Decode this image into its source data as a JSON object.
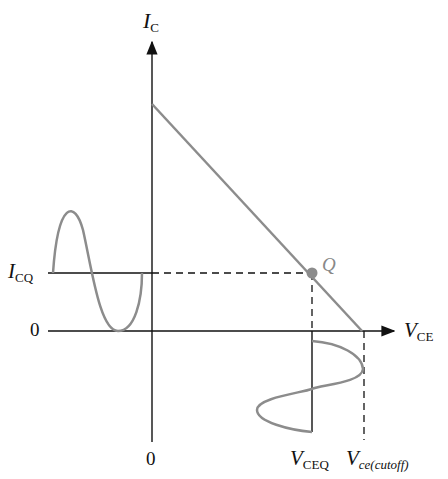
{
  "labels": {
    "ic_main": "I",
    "ic_sub": "C",
    "icq_main": "I",
    "icq_sub": "CQ",
    "zero_y": "0",
    "zero_x": "0",
    "vce_main": "V",
    "vce_sub": "CE",
    "vceq_main": "V",
    "vceq_sub": "CEQ",
    "vcutoff_main": "V",
    "vcutoff_sub": "ce(cutoff)",
    "q_point": "Q"
  },
  "colors": {
    "axis": "#111111",
    "curve": "#8c8c8c",
    "q_dot": "#8c8c8c"
  }
}
